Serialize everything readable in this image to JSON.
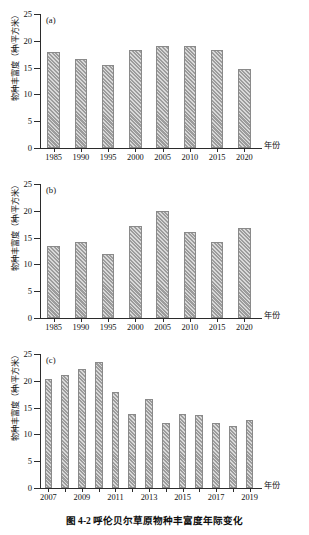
{
  "figure": {
    "caption": "图 4-2  呼伦贝尔草原物种丰富度年际变化",
    "ylabel": "物种丰富度（种/平方米）",
    "xlabel": "年份",
    "bar_color": "#9c9c9c",
    "axis_color": "#2b2b2b"
  },
  "chart_data": [
    {
      "type": "bar",
      "panel": "(a)",
      "title": "",
      "xlabel": "年份",
      "ylabel": "物种丰富度（种/平方米）",
      "categories": [
        "1985",
        "1990",
        "1995",
        "2000",
        "2005",
        "2010",
        "2015",
        "2020"
      ],
      "tick_labels": [
        "1985",
        "1990",
        "1995",
        "2000",
        "2005",
        "2010",
        "2015",
        "2020"
      ],
      "values": [
        18.0,
        16.6,
        15.5,
        18.3,
        19.1,
        19.1,
        18.2,
        14.8
      ],
      "ylim": [
        0,
        25
      ],
      "yticks": [
        0,
        5,
        10,
        15,
        20,
        25
      ],
      "grid": false,
      "legend": null
    },
    {
      "type": "bar",
      "panel": "(b)",
      "title": "",
      "xlabel": "年份",
      "ylabel": "物种丰富度（种/平方米）",
      "categories": [
        "1985",
        "1990",
        "1995",
        "2000",
        "2005",
        "2010",
        "2015",
        "2020"
      ],
      "tick_labels": [
        "1985",
        "1990",
        "1995",
        "2000",
        "2005",
        "2010",
        "2015",
        "2020"
      ],
      "values": [
        13.4,
        14.2,
        12.0,
        17.2,
        19.9,
        16.1,
        14.2,
        16.8
      ],
      "ylim": [
        0,
        25
      ],
      "yticks": [
        0,
        5,
        10,
        15,
        20,
        25
      ],
      "grid": false,
      "legend": null
    },
    {
      "type": "bar",
      "panel": "(c)",
      "title": "",
      "xlabel": "年份",
      "ylabel": "物种丰富度（种/平方米）",
      "categories": [
        "2007",
        "2008",
        "2009",
        "2010",
        "2011",
        "2012",
        "2013",
        "2014",
        "2015",
        "2016",
        "2017",
        "2018",
        "2019"
      ],
      "tick_labels": [
        "2007",
        "",
        "2009",
        "",
        "2011",
        "",
        "2013",
        "",
        "2015",
        "",
        "2017",
        "",
        "2019"
      ],
      "values": [
        20.3,
        21.0,
        22.2,
        23.6,
        18.0,
        13.9,
        16.7,
        12.1,
        13.8,
        13.6,
        12.1,
        11.5,
        12.7,
        11.7
      ],
      "ylim": [
        0,
        25
      ],
      "yticks": [
        0,
        5,
        10,
        15,
        20,
        25
      ],
      "grid": false,
      "legend": null
    }
  ]
}
